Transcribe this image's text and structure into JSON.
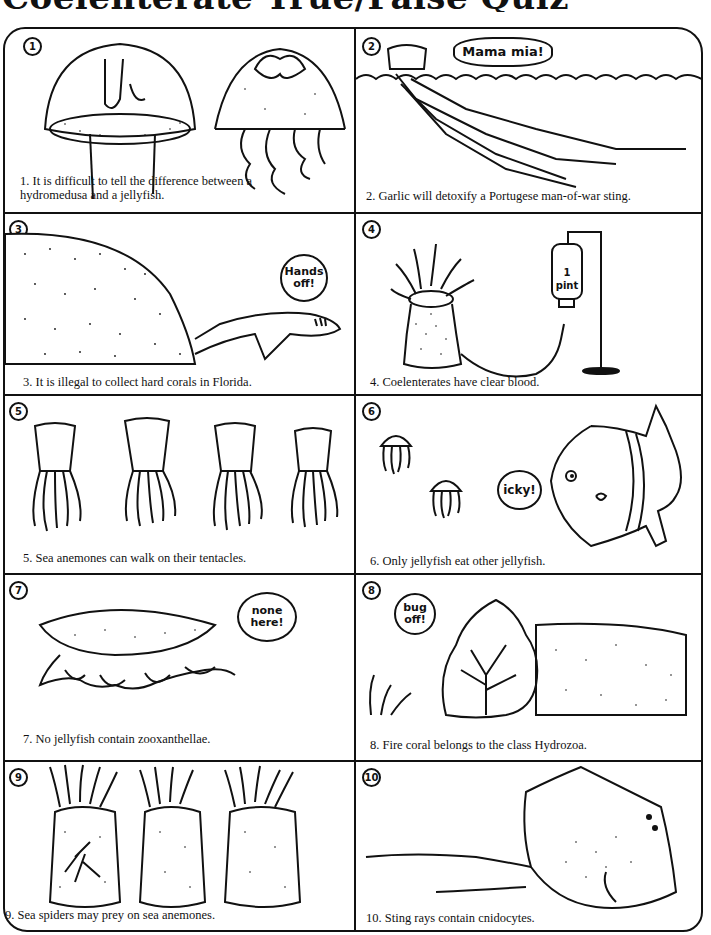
{
  "page": {
    "title": "Coelenterate True/False Quiz"
  },
  "panels": [
    {
      "number": "1",
      "caption": "1. It is difficult to tell the difference between a  hydromedusa and a jellyfish.",
      "bubble": ""
    },
    {
      "number": "2",
      "caption": "2. Garlic will detoxify a Portugese man-of-war sting.",
      "bubble": "Mama mia!"
    },
    {
      "number": "3",
      "caption": "3. It is illegal to collect hard corals in Florida.",
      "bubble": "Hands off!"
    },
    {
      "number": "4",
      "caption": "4. Coelenterates have clear blood.",
      "bubble": "",
      "iv_bag_label": "1 pint"
    },
    {
      "number": "5",
      "caption": "5. Sea anemones can walk on their tentacles.",
      "bubble": ""
    },
    {
      "number": "6",
      "caption": "6. Only jellyfish eat other jellyfish.",
      "bubble": "icky!"
    },
    {
      "number": "7",
      "caption": "7. No jellyfish contain zooxanthellae.",
      "bubble": "none here!"
    },
    {
      "number": "8",
      "caption": "8. Fire coral belongs to the class Hydrozoa.",
      "bubble": "bug off!"
    },
    {
      "number": "9",
      "caption": "9. Sea spiders may prey on sea anemones.",
      "bubble": ""
    },
    {
      "number": "10",
      "caption": "10. Sting rays contain cnidocytes.",
      "bubble": ""
    }
  ],
  "colors": {
    "ink": "#111111",
    "paper": "#ffffff"
  }
}
